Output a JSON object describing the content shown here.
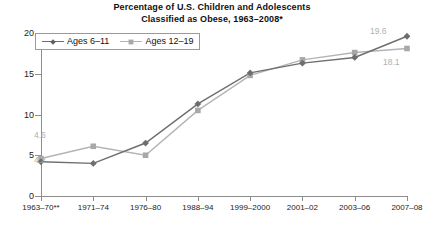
{
  "chart_data": {
    "type": "line",
    "title": "Percentage of U.S. Children and Adolescents",
    "title_line2": "Classified as Obese, 1963–2008*",
    "xlabel": "",
    "ylabel": "",
    "categories": [
      "1963–70**",
      "1971–74",
      "1976–80",
      "1988–94",
      "1999–2000",
      "2001–02",
      "2003–06",
      "2007–08"
    ],
    "ylim": [
      0,
      20
    ],
    "yticks": [
      0,
      5,
      10,
      15,
      20
    ],
    "ytick_labels": [
      "0",
      "5",
      "10",
      "15",
      "20"
    ],
    "grid": false,
    "legend_position": "top-left",
    "series": [
      {
        "name": "Ages 6–11",
        "marker": "diamond",
        "color": "#6e6e6e",
        "values": [
          4.2,
          4.0,
          6.5,
          11.3,
          15.1,
          16.3,
          17.0,
          19.6
        ]
      },
      {
        "name": "Ages 12–19",
        "marker": "square",
        "color": "#a8a8a8",
        "values": [
          4.6,
          6.1,
          5.0,
          10.5,
          14.8,
          16.7,
          17.6,
          18.1
        ]
      }
    ],
    "annotations": [
      {
        "text": "4.6",
        "series": "Ages 12–19",
        "category": "1963–70**",
        "position": "above-left"
      },
      {
        "text": "4.2",
        "series": "Ages 6–11",
        "category": "1963–70**",
        "position": "below-left"
      },
      {
        "text": "19.6",
        "series": "Ages 6–11",
        "category": "2007–08",
        "position": "above-left"
      },
      {
        "text": "18.1",
        "series": "Ages 12–19",
        "category": "2007–08",
        "position": "below-right"
      }
    ]
  },
  "colors": {
    "series_1": "#6e6e6e",
    "series_2": "#a8a8a8",
    "axis": "#8d8d8d",
    "label": "#b0b0b0",
    "text": "#222222",
    "background": "#ffffff"
  }
}
